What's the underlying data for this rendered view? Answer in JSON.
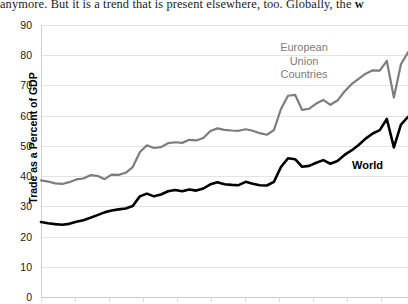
{
  "document_text": {
    "line": "anymore. But it is a trend that is present elsewhere, too. Globally, the ",
    "bold_tail": "w"
  },
  "chart_data": {
    "type": "line",
    "title": "",
    "xlabel": "",
    "ylabel": "Trade as a Percent of GDP",
    "ylim": [
      0,
      90
    ],
    "yticks": [
      0,
      10,
      20,
      30,
      40,
      50,
      60,
      70,
      80,
      90
    ],
    "ytick_labels": [
      "0",
      "10",
      "20",
      "30",
      "40",
      "50",
      "60",
      "70",
      "80",
      "90"
    ],
    "grid": true,
    "legend_position": "inline-annotation",
    "x": [
      1,
      2,
      3,
      4,
      5,
      6,
      7,
      8,
      9,
      10,
      11,
      12,
      13,
      14,
      15,
      16,
      17,
      18,
      19,
      20,
      21,
      22,
      23,
      24,
      25,
      26,
      27,
      28,
      29,
      30,
      31,
      32,
      33,
      34,
      35,
      36,
      37,
      38,
      39,
      40,
      41,
      42,
      43,
      44,
      45,
      46,
      47,
      48,
      49,
      50,
      51,
      52,
      53
    ],
    "series": [
      {
        "name": "European Union Countries",
        "color": "#7d7d7d",
        "line_width": 2.2,
        "annotation": "European\nUnion\nCountries",
        "values": [
          38.6,
          38.2,
          37.6,
          37.4,
          38.0,
          38.9,
          39.2,
          40.3,
          40.1,
          39.0,
          40.5,
          40.4,
          41.1,
          43.0,
          47.9,
          50.2,
          49.3,
          49.6,
          50.9,
          51.2,
          51.0,
          52.0,
          51.8,
          52.6,
          54.9,
          55.8,
          55.3,
          55.1,
          55.0,
          55.5,
          55.0,
          54.2,
          53.7,
          55.2,
          62.2,
          66.6,
          66.9,
          61.9,
          62.3,
          64.0,
          65.2,
          63.6,
          65.0,
          68.0,
          70.4,
          72.2,
          73.9,
          75.0,
          74.9,
          78.1,
          66.0,
          77.0,
          81.0
        ]
      },
      {
        "name": "World",
        "color": "#000000",
        "line_width": 2.6,
        "annotation": "World",
        "values": [
          24.8,
          24.4,
          24.1,
          23.9,
          24.2,
          24.9,
          25.4,
          26.2,
          27.1,
          28.0,
          28.6,
          29.0,
          29.3,
          30.1,
          33.3,
          34.2,
          33.3,
          33.9,
          35.0,
          35.4,
          35.0,
          35.6,
          35.2,
          35.9,
          37.3,
          38.0,
          37.3,
          37.1,
          37.0,
          38.1,
          37.5,
          37.0,
          36.9,
          38.1,
          43.0,
          45.9,
          45.6,
          43.1,
          43.4,
          44.4,
          45.3,
          44.1,
          45.0,
          47.0,
          48.5,
          50.3,
          52.4,
          54.1,
          55.2,
          58.9,
          49.5,
          57.0,
          59.6
        ]
      }
    ]
  }
}
